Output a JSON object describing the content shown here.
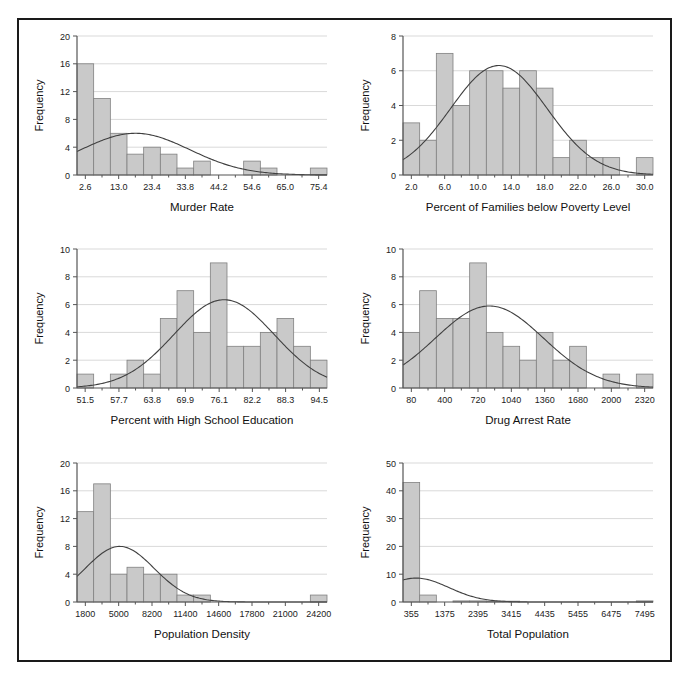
{
  "figure": {
    "background": "#ffffff",
    "frame_color": "#1a1a1a",
    "bar_fill": "#c9c9c9",
    "bar_stroke": "#808080",
    "axis_color": "#555555",
    "grid_color": "#d9d9d9",
    "curve_color": "#404040",
    "ylabel": "Frequency"
  },
  "chart_data": [
    {
      "type": "bar",
      "id": "murder-rate",
      "title": "",
      "xlabel": "Murder Rate",
      "ylabel": "Frequency",
      "ylim": [
        0,
        20
      ],
      "yticks": [
        0,
        4,
        8,
        12,
        16,
        20
      ],
      "xticks": [
        2.6,
        13.0,
        23.4,
        33.8,
        44.2,
        54.6,
        65.0,
        75.4
      ],
      "xtick_labels": [
        "2.6",
        "13.0",
        "23.4",
        "33.8",
        "44.2",
        "54.6",
        "65.0",
        "75.4"
      ],
      "bin_width": 5.2,
      "bin_starts": [
        0.0,
        5.2,
        10.4,
        15.6,
        20.8,
        26.0,
        31.2,
        36.4,
        41.6,
        46.8,
        52.0,
        57.2,
        62.4,
        67.6,
        72.8
      ],
      "values": [
        16,
        11,
        6,
        3,
        4,
        3,
        1,
        2,
        0,
        0,
        2,
        1,
        0,
        0,
        1
      ],
      "grid": true,
      "normal_curve": {
        "shown": true,
        "mean": 18.2,
        "sd": 17.0,
        "peak": 6.0
      }
    },
    {
      "type": "bar",
      "id": "poverty-level",
      "title": "",
      "xlabel": "Percent of Families below Poverty Level",
      "ylabel": "Frequency",
      "ylim": [
        0,
        8
      ],
      "yticks": [
        0,
        2,
        4,
        6,
        8
      ],
      "xticks": [
        2.0,
        6.0,
        10.0,
        14.0,
        18.0,
        22.0,
        26.0,
        30.0
      ],
      "xtick_labels": [
        "2.0",
        "6.0",
        "10.0",
        "14.0",
        "18.0",
        "22.0",
        "26.0",
        "30.0"
      ],
      "bin_width": 2.0,
      "bin_starts": [
        1.0,
        3.0,
        5.0,
        7.0,
        9.0,
        11.0,
        13.0,
        15.0,
        17.0,
        19.0,
        21.0,
        23.0,
        25.0,
        27.0,
        29.0
      ],
      "values": [
        3,
        2,
        7,
        4,
        6,
        6,
        5,
        6,
        5,
        1,
        2,
        1,
        1,
        0,
        1
      ],
      "grid": true,
      "normal_curve": {
        "shown": true,
        "mean": 12.5,
        "sd": 5.8,
        "peak": 6.3
      }
    },
    {
      "type": "bar",
      "id": "high-school-education",
      "title": "",
      "xlabel": "Percent with High School Education",
      "ylabel": "Frequency",
      "ylim": [
        0,
        10
      ],
      "yticks": [
        0,
        2,
        4,
        6,
        8,
        10
      ],
      "xticks": [
        51.5,
        57.7,
        63.8,
        69.9,
        76.1,
        82.2,
        88.3,
        94.5
      ],
      "xtick_labels": [
        "51.5",
        "57.7",
        "63.8",
        "69.9",
        "76.1",
        "82.2",
        "88.3",
        "94.5"
      ],
      "bin_width": 3.06,
      "bin_starts": [
        50.0,
        53.06,
        56.12,
        59.18,
        62.24,
        65.3,
        68.36,
        71.42,
        74.48,
        77.54,
        80.6,
        83.66,
        86.72,
        89.78,
        92.84
      ],
      "values": [
        1,
        0,
        1,
        2,
        1,
        5,
        7,
        4,
        9,
        3,
        3,
        4,
        5,
        3,
        2
      ],
      "grid": true,
      "normal_curve": {
        "shown": true,
        "mean": 77.0,
        "sd": 9.2,
        "peak": 6.35
      }
    },
    {
      "type": "bar",
      "id": "drug-arrest-rate",
      "title": "",
      "xlabel": "Drug Arrest Rate",
      "ylabel": "Frequency",
      "ylim": [
        0,
        10
      ],
      "yticks": [
        0,
        2,
        4,
        6,
        8,
        10
      ],
      "xticks": [
        80,
        400,
        720,
        1040,
        1360,
        1680,
        2000,
        2320
      ],
      "xtick_labels": [
        "80",
        "400",
        "720",
        "1040",
        "1360",
        "1680",
        "2000",
        "2320"
      ],
      "bin_width": 160,
      "bin_starts": [
        0,
        160,
        320,
        480,
        640,
        800,
        960,
        1120,
        1280,
        1440,
        1600,
        1760,
        1920,
        2080,
        2240
      ],
      "values": [
        4,
        7,
        5,
        5,
        9,
        4,
        3,
        2,
        4,
        2,
        3,
        0,
        1,
        0,
        1
      ],
      "grid": true,
      "normal_curve": {
        "shown": true,
        "mean": 830,
        "sd": 520,
        "peak": 5.9
      }
    },
    {
      "type": "bar",
      "id": "population-density",
      "title": "",
      "xlabel": "Population Density",
      "ylabel": "Frequency",
      "ylim": [
        0,
        20
      ],
      "yticks": [
        0,
        4,
        8,
        12,
        16,
        20
      ],
      "xticks": [
        1800,
        5000,
        8200,
        11400,
        14600,
        17800,
        21000,
        24200
      ],
      "xtick_labels": [
        "1800",
        "5000",
        "8200",
        "11400",
        "14600",
        "17800",
        "21000",
        "24200"
      ],
      "bin_width": 1600,
      "bin_starts": [
        1000,
        2600,
        4200,
        5800,
        7400,
        9000,
        10600,
        12200,
        13800,
        15400,
        17000,
        18600,
        20200,
        21800,
        23400
      ],
      "values": [
        13,
        17,
        4,
        5,
        4,
        4,
        1,
        1,
        0,
        0,
        0,
        0,
        0,
        0,
        1
      ],
      "grid": true,
      "normal_curve": {
        "shown": true,
        "mean": 5100,
        "sd": 3300,
        "peak": 8.0
      }
    },
    {
      "type": "bar",
      "id": "total-population",
      "title": "",
      "xlabel": "Total Population",
      "ylabel": "Frequency",
      "ylim": [
        0,
        50
      ],
      "yticks": [
        0,
        10,
        20,
        30,
        40,
        50
      ],
      "xticks": [
        355,
        1375,
        2395,
        3415,
        4435,
        5455,
        6475,
        7495
      ],
      "xtick_labels": [
        "355",
        "1375",
        "2395",
        "3415",
        "4435",
        "5455",
        "6475",
        "7495"
      ],
      "bin_width": 510,
      "bin_starts": [
        100,
        610,
        1120,
        1630,
        2140,
        2650,
        3160,
        3670,
        4180,
        4690,
        5200,
        5710,
        6220,
        6730,
        7240
      ],
      "values": [
        43,
        2.5,
        0,
        0.4,
        0.4,
        0.3,
        0.3,
        0,
        0,
        0,
        0,
        0,
        0,
        0,
        0.4
      ],
      "grid": true,
      "normal_curve": {
        "shown": true,
        "mean": 500,
        "sd": 1000,
        "peak": 8.6
      }
    }
  ]
}
